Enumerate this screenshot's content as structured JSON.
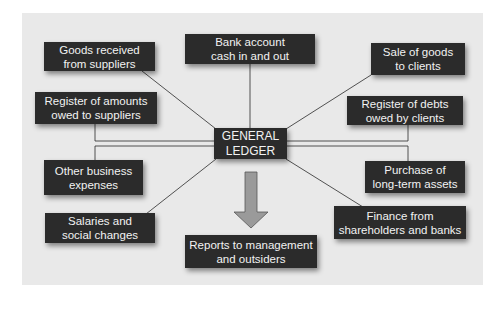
{
  "diagram": {
    "center": {
      "label": "GENERAL\nLEDGER"
    },
    "nodes": [
      {
        "id": "goods-received",
        "label": "Goods received\nfrom suppliers"
      },
      {
        "id": "bank-account",
        "label": "Bank account\ncash in and out"
      },
      {
        "id": "sale-of-goods",
        "label": "Sale of goods\nto clients"
      },
      {
        "id": "register-amounts-owed",
        "label": "Register of amounts\nowed to suppliers"
      },
      {
        "id": "register-debts",
        "label": "Register of debts\nowed by clients"
      },
      {
        "id": "other-expenses",
        "label": "Other business\nexpenses"
      },
      {
        "id": "purchase-assets",
        "label": "Purchase of\nlong-term assets"
      },
      {
        "id": "salaries",
        "label": "Salaries and\nsocial changes"
      },
      {
        "id": "finance",
        "label": "Finance from\nshareholders and banks"
      },
      {
        "id": "reports",
        "label": "Reports to management\nand outsiders"
      }
    ],
    "colors": {
      "box_fill": "#2b2b2b",
      "box_text": "#f2f2f2",
      "background_panel": "#e9e9e9",
      "connector": "#2a2a2a",
      "arrow_fill": "#9a9a9a"
    }
  }
}
